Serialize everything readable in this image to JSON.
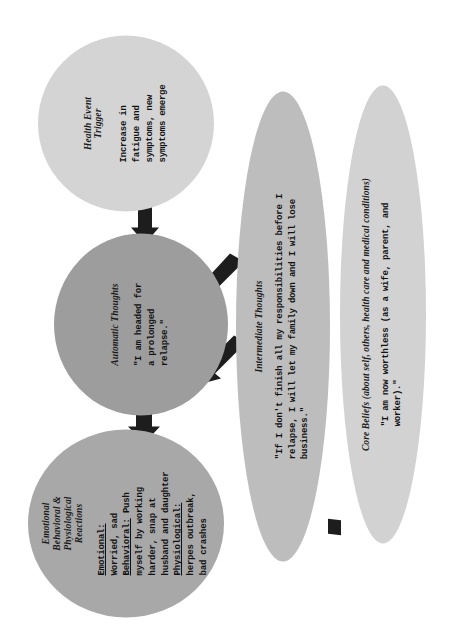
{
  "diagram": {
    "type": "cbt-case-conceptualization",
    "background_color": "#ffffff",
    "arrow_color": "#1d1d1d",
    "nodes": [
      {
        "id": "reactions",
        "title": "Emotional\nBehavioral &\nPhysiological\nReactions",
        "body": "Emotional:\nWorried, sad\nBehavioral: Push\nmyself by working\nharder, snap at\nhusband and daughter\nPhysiological:\nherpes outbreak,\nbad crashes",
        "fill_color": "#a8a8a8"
      },
      {
        "id": "automatic",
        "title": "Automatic Thoughts",
        "body": "\"I am headed for\na prolonged\nrelapse.\"",
        "fill_color": "#9d9d9d"
      },
      {
        "id": "trigger",
        "title": "Health Event\nTrigger",
        "body": "Increase in\nfatigue and\nsymptoms, new\nsymptoms emerge",
        "fill_color": "#d4d4d4"
      },
      {
        "id": "intermediate",
        "title": "Intermediate Thoughts",
        "body": "\"If I don't finish all my responsibilities before I\nrelapse, I will let my family down and I will lose\nbusiness.\"",
        "fill_color": "#bdbdbd"
      },
      {
        "id": "core",
        "title": "Core Beliefs (about self, others, health care and medical conditions)",
        "body": "\"I am now worthless (as a wife, parent, and\nworker).\"",
        "fill_color": "#d2d2d2"
      }
    ],
    "reactions_body_labels": {
      "emotional": "Emotional:",
      "emotional_value": "Worried, sad",
      "behavioral": "Behavioral:",
      "behavioral_value": " Push\nmyself by working\nharder, snap at\nhusband and daughter",
      "physiological": "Physiological:",
      "physiological_value": "herpes outbreak,\nbad crashes"
    },
    "arrows": [
      {
        "id": "trigger-to-automatic",
        "from": "trigger",
        "to": "automatic"
      },
      {
        "id": "automatic-to-reactions",
        "from": "automatic",
        "to": "reactions"
      },
      {
        "id": "intermediate-to-automatic-upper",
        "from": "intermediate",
        "to": "automatic"
      },
      {
        "id": "intermediate-to-automatic-lower",
        "from": "intermediate",
        "to": "automatic"
      },
      {
        "id": "core-to-intermediate",
        "from": "core",
        "to": "intermediate"
      }
    ]
  }
}
